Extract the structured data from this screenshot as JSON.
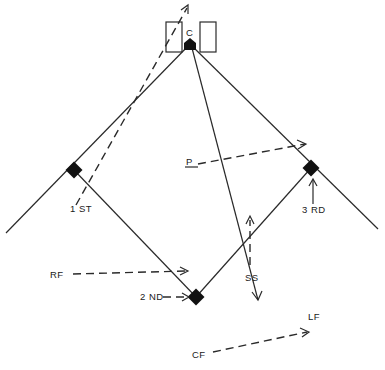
{
  "diagram": {
    "type": "baseball-field-position-diagram",
    "colors": {
      "ink": "#111111",
      "background": "#ffffff"
    },
    "labels": {
      "catcher": "C",
      "first_base": "1 ST",
      "second_base": "2 ND",
      "third_base": "3 RD",
      "pitcher": "P",
      "right_field": "RF",
      "shortstop": "SS",
      "left_field": "LF",
      "center_field": "CF"
    },
    "bases": [
      {
        "name": "home",
        "shape": "pentagon"
      },
      {
        "name": "first",
        "shape": "diamond"
      },
      {
        "name": "second",
        "shape": "diamond"
      },
      {
        "name": "third",
        "shape": "diamond"
      }
    ],
    "movements": [
      {
        "from": "1 ST",
        "to": "behind home plate",
        "style": "dashed-arrow"
      },
      {
        "from": "P",
        "to": "3 RD line",
        "style": "dashed-arrow"
      },
      {
        "from": "RF",
        "to": "2 ND baseline",
        "style": "dashed-arrow"
      },
      {
        "from": "2 ND label",
        "to": "2 ND base",
        "style": "dashed-arrow"
      },
      {
        "from": "3 RD label",
        "to": "3 RD base",
        "style": "arrow"
      },
      {
        "from": "SS",
        "to": "infield",
        "style": "dashed-arrow"
      },
      {
        "from": "C",
        "to": "LF",
        "style": "solid-arrow"
      },
      {
        "from": "CF",
        "to": "LF",
        "style": "dashed-arrow"
      }
    ]
  }
}
